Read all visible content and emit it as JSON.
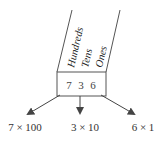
{
  "diagram": {
    "number": "736",
    "digits": [
      "7",
      "3",
      "6"
    ],
    "place_labels": [
      "Hundreds",
      "Tens",
      "Ones"
    ],
    "expansions": [
      "7 × 100",
      "3 × 10",
      "6 × 1"
    ],
    "colors": {
      "line": "#555555",
      "text": "#333333"
    }
  }
}
